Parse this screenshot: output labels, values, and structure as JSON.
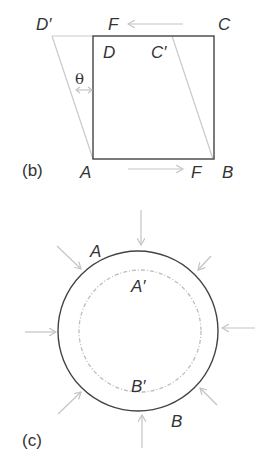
{
  "panel_b": {
    "label": "(b)",
    "vertices": {
      "A": "A",
      "B": "B",
      "C": "C",
      "D": "D"
    },
    "sheared_vertices": {
      "C_prime": "C′",
      "D_prime": "D′"
    },
    "force_top": "F",
    "force_bottom": "F",
    "angle": "θ"
  },
  "panel_c": {
    "label": "(c)",
    "outer_points": {
      "A": "A",
      "B": "B"
    },
    "inner_points": {
      "A_prime": "A′",
      "B_prime": "B′"
    },
    "arrow_count": 8
  },
  "colors": {
    "outline": "#444444",
    "deformed": "#c9c9c9",
    "arrows": "#c4c4c4",
    "text": "#333333"
  }
}
